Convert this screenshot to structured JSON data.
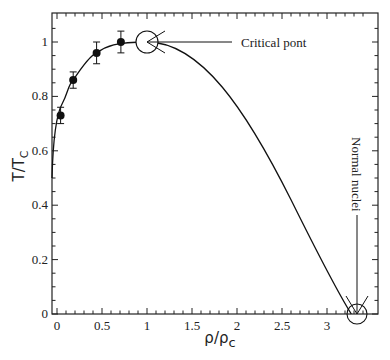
{
  "chart_data": {
    "type": "line",
    "title": "",
    "xlabel": "ρ/ρc",
    "xlabel_main": "ρ/ρ",
    "xlabel_sub": "c",
    "ylabel": "T/TC",
    "ylabel_main": "T/T",
    "ylabel_sub": "C",
    "xlim": [
      -0.05,
      3.5
    ],
    "ylim": [
      0,
      1.1
    ],
    "x_ticks": [
      0,
      0.5,
      1,
      1.5,
      2,
      2.5,
      3
    ],
    "x_tick_labels": [
      "0",
      "0.5",
      "1",
      "1.5",
      "2",
      "2.5",
      "3"
    ],
    "y_ticks": [
      0,
      0.2,
      0.4,
      0.6,
      0.8,
      1
    ],
    "y_tick_labels": [
      "0",
      "0.2",
      "0.4",
      "0.6",
      "0.8",
      "1"
    ],
    "grid": false,
    "legend": null,
    "series": [
      {
        "name": "data",
        "kind": "scatter-with-errorbars",
        "x": [
          0.04,
          0.18,
          0.44,
          0.71
        ],
        "y": [
          0.73,
          0.86,
          0.96,
          1.0
        ],
        "yerr": [
          0.03,
          0.03,
          0.04,
          0.04
        ]
      },
      {
        "name": "curve",
        "kind": "line",
        "x": [
          -0.05,
          0.0,
          0.04,
          0.18,
          0.44,
          0.71,
          1.0,
          1.5,
          2.0,
          2.5,
          3.0,
          3.27
        ],
        "y": [
          0.5,
          0.62,
          0.72,
          0.86,
          0.96,
          1.0,
          1.0,
          0.93,
          0.75,
          0.5,
          0.2,
          0.0
        ]
      }
    ],
    "annotations": [
      {
        "text": "Critical pont",
        "x": 1.0,
        "y": 1.0,
        "marker": "open-circle"
      },
      {
        "text": "Normal nuclei",
        "x": 3.27,
        "y": 0.0,
        "marker": "open-circle",
        "orientation": "vertical"
      }
    ]
  }
}
